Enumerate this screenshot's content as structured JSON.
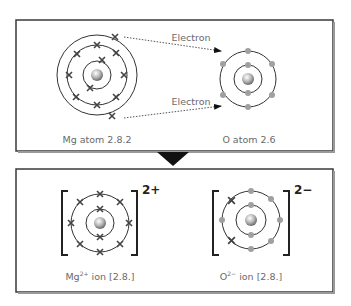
{
  "top_panel": {
    "mg_atom": {
      "label": "Mg atom 2.8.2",
      "shells": [
        2,
        8,
        2
      ]
    },
    "o_atom": {
      "label": "O atom 2.6",
      "shells": [
        2,
        6
      ]
    },
    "arrows": [
      {
        "label": "Electron"
      },
      {
        "label": "Electron"
      }
    ]
  },
  "transition": {
    "icon": "down-triangle-arrow"
  },
  "bottom_panel": {
    "mg_ion": {
      "label_base": "Mg",
      "label_sup": "2+",
      "label_rest": " ion [2.8.]",
      "charge": "2+",
      "shells": [
        2,
        8
      ]
    },
    "o_ion": {
      "label_base": "O",
      "label_sup": "2−",
      "label_rest": " ion [2.8.]",
      "charge": "2−",
      "shells": [
        2,
        8
      ]
    }
  },
  "colors": {
    "border": "#3a3a3a",
    "orbit": "#333333",
    "mg_electron": "#444444",
    "o_electron": "#a0a0a0",
    "text": "#6a6a6a",
    "dotted_line": "#555555"
  }
}
